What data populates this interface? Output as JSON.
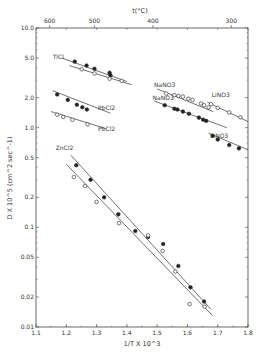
{
  "chart_data": {
    "type": "scatter",
    "title": "",
    "xlabel": "1/T X 10^3",
    "ylabel": "D X 10^5 (cm^2 sec^-1)",
    "top_axis_label": "t(°C)",
    "x_range": [
      1.1,
      1.8
    ],
    "y_range": [
      0.01,
      10.0
    ],
    "y_scale": "log",
    "grid": false,
    "x_ticks": [
      "1.1",
      "1.2",
      "1.3",
      "1.4",
      "1.5",
      "1.6",
      "1.7",
      "1.8"
    ],
    "y_ticks": [
      "10.0",
      "5.0",
      "2.0",
      "1.0",
      "0.5",
      "0.2",
      "0.1",
      "0.05",
      "0.02",
      "0.01"
    ],
    "top_ticks": [
      {
        "label": "600",
        "x": 1.145
      },
      {
        "label": "500",
        "x": 1.293
      },
      {
        "label": "400",
        "x": 1.486
      },
      {
        "label": "300",
        "x": 1.745
      }
    ],
    "series": [
      {
        "name": "TlCl (filled)",
        "label": "TlCl",
        "marker": "filled",
        "line": [
          [
            1.185,
            5.0
          ],
          [
            1.4,
            2.9
          ]
        ],
        "points": [
          [
            1.228,
            4.6
          ],
          [
            1.267,
            4.2
          ],
          [
            1.293,
            3.9
          ],
          [
            1.343,
            3.55
          ],
          [
            1.346,
            3.35
          ]
        ]
      },
      {
        "name": "TlCl (open)",
        "label": "",
        "marker": "open",
        "line": [
          [
            1.21,
            4.2
          ],
          [
            1.416,
            2.7
          ]
        ],
        "points": [
          [
            1.251,
            3.85
          ],
          [
            1.293,
            3.5
          ],
          [
            1.343,
            3.1
          ],
          [
            1.383,
            2.95
          ]
        ]
      },
      {
        "name": "PbCl2 (filled)",
        "label": "PbCl2",
        "marker": "filled",
        "line": [
          [
            1.155,
            2.35
          ],
          [
            1.345,
            1.4
          ]
        ],
        "points": [
          [
            1.17,
            2.15
          ],
          [
            1.205,
            1.9
          ],
          [
            1.235,
            1.7
          ],
          [
            1.253,
            1.6
          ],
          [
            1.268,
            1.52
          ]
        ]
      },
      {
        "name": "PbCl2 (open)",
        "label": "PbCl2",
        "marker": "open",
        "line": [
          [
            1.15,
            1.45
          ],
          [
            1.33,
            0.98
          ]
        ],
        "points": [
          [
            1.17,
            1.35
          ],
          [
            1.19,
            1.28
          ],
          [
            1.22,
            1.2
          ],
          [
            1.27,
            1.08
          ]
        ]
      },
      {
        "name": "NaNO3 (open)",
        "label": "NaNO3",
        "marker": "open",
        "line": [
          [
            1.5,
            2.45
          ],
          [
            1.685,
            1.45
          ]
        ],
        "points": [
          [
            1.53,
            2.2
          ],
          [
            1.557,
            2.12
          ],
          [
            1.57,
            2.08
          ],
          [
            1.585,
            2.05
          ],
          [
            1.603,
            1.95
          ],
          [
            1.617,
            1.9
          ],
          [
            1.645,
            1.75
          ],
          [
            1.655,
            1.68
          ],
          [
            1.67,
            1.6
          ]
        ]
      },
      {
        "name": "NaNO3 (filled)",
        "label": "NaNO3",
        "marker": "filled",
        "line": [
          [
            1.49,
            1.85
          ],
          [
            1.73,
            1.0
          ]
        ],
        "points": [
          [
            1.525,
            1.68
          ],
          [
            1.557,
            1.55
          ],
          [
            1.567,
            1.52
          ],
          [
            1.585,
            1.45
          ],
          [
            1.605,
            1.38
          ],
          [
            1.638,
            1.26
          ],
          [
            1.652,
            1.2
          ],
          [
            1.662,
            1.17
          ]
        ]
      },
      {
        "name": "LiNO3 (open)",
        "label": "LiNO3",
        "marker": "open",
        "line": [
          [
            1.666,
            1.8
          ],
          [
            1.8,
            1.15
          ]
        ],
        "points": [
          [
            1.678,
            1.72
          ],
          [
            1.7,
            1.58
          ],
          [
            1.738,
            1.42
          ],
          [
            1.775,
            1.27
          ]
        ]
      },
      {
        "name": "LiNO3 (filled)",
        "label": "LiNO3",
        "marker": "filled",
        "line": [
          [
            1.67,
            0.88
          ],
          [
            1.8,
            0.6
          ]
        ],
        "points": [
          [
            1.683,
            0.83
          ],
          [
            1.7,
            0.76
          ],
          [
            1.738,
            0.67
          ],
          [
            1.77,
            0.62
          ]
        ]
      },
      {
        "name": "ZnCl2 (filled)",
        "label": "ZnCl2",
        "marker": "filled",
        "line": [
          [
            1.215,
            0.53
          ],
          [
            1.678,
            0.015
          ]
        ],
        "points": [
          [
            1.233,
            0.42
          ],
          [
            1.28,
            0.3
          ],
          [
            1.325,
            0.2
          ],
          [
            1.372,
            0.135
          ],
          [
            1.428,
            0.092
          ],
          [
            1.47,
            0.08
          ],
          [
            1.52,
            0.068
          ],
          [
            1.57,
            0.041
          ],
          [
            1.61,
            0.025
          ],
          [
            1.655,
            0.018
          ]
        ]
      },
      {
        "name": "ZnCl2 (open)",
        "label": "",
        "marker": "open",
        "line": [
          [
            1.2,
            0.43
          ],
          [
            1.683,
            0.013
          ]
        ],
        "points": [
          [
            1.225,
            0.32
          ],
          [
            1.262,
            0.26
          ],
          [
            1.3,
            0.18
          ],
          [
            1.374,
            0.11
          ],
          [
            1.47,
            0.083
          ],
          [
            1.518,
            0.058
          ],
          [
            1.56,
            0.036
          ],
          [
            1.607,
            0.017
          ],
          [
            1.657,
            0.016
          ]
        ]
      }
    ],
    "annotations": [
      {
        "text": "TlCl",
        "x": 1.155,
        "y": 4.9
      },
      {
        "text": "PbCl2",
        "x": 1.305,
        "y": 1.5
      },
      {
        "text": "PbCl2",
        "x": 1.305,
        "y": 0.92
      },
      {
        "text": "NaNO3",
        "x": 1.49,
        "y": 2.55
      },
      {
        "text": "NaNO3",
        "x": 1.485,
        "y": 1.9
      },
      {
        "text": "LiNO3",
        "x": 1.68,
        "y": 2.05
      },
      {
        "text": "LiNO3",
        "x": 1.675,
        "y": 0.78
      },
      {
        "text": "ZnCl2",
        "x": 1.165,
        "y": 0.6
      }
    ]
  }
}
